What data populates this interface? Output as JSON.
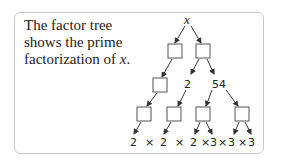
{
  "description": {
    "text_before": "The factor tree shows the prime factorization of ",
    "variable": "x",
    "text_after": "."
  },
  "tree": {
    "root_label": "x",
    "level2_labels": [
      "2",
      "54"
    ],
    "bottom_row": [
      "2",
      "×",
      "2",
      "×",
      "2",
      "×",
      "3",
      "×",
      "3",
      "×",
      "3"
    ],
    "colors": {
      "line": "#333333",
      "box_border": "#555555",
      "card_border": "#c8c8c8"
    }
  }
}
